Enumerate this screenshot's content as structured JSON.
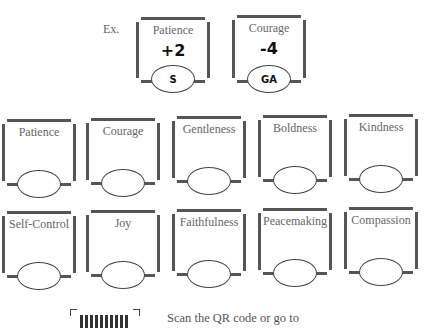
{
  "example": {
    "label": "Ex.",
    "cards": [
      {
        "title": "Patience",
        "score": "+2",
        "oval": "S"
      },
      {
        "title": "Courage",
        "score": "-4",
        "oval": "GA"
      }
    ]
  },
  "grid": {
    "row1": [
      {
        "title": "Patience"
      },
      {
        "title": "Courage"
      },
      {
        "title": "Gentleness"
      },
      {
        "title": "Boldness"
      },
      {
        "title": "Kindness"
      }
    ],
    "row2": [
      {
        "title": "Self-Control"
      },
      {
        "title": "Joy"
      },
      {
        "title": "Faithfulness"
      },
      {
        "title": "Peacemaking"
      },
      {
        "title": "Compassion"
      }
    ]
  },
  "footer": {
    "qr_icon": "qr-code-icon",
    "text": "Scan the QR code or go to"
  }
}
